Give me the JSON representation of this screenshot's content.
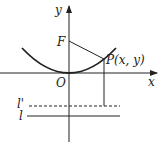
{
  "diagram": {
    "type": "parabola-focus-directrix",
    "labels": {
      "y_axis": "y",
      "x_axis": "x",
      "origin": "O",
      "focus": "F",
      "point": "P(x, y)",
      "line_dashed": "l'",
      "line_solid": "l"
    },
    "colors": {
      "stroke": "#222222",
      "background": "#ffffff"
    }
  }
}
